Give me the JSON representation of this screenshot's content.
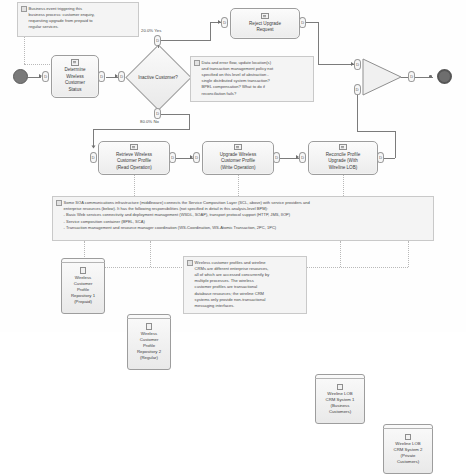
{
  "diagram": {
    "type": "bpmn-process-diagram"
  },
  "events": {
    "start": {
      "name": "start-event",
      "label": ""
    },
    "end": {
      "name": "end-event",
      "label": ""
    }
  },
  "tasks": {
    "determine_status": {
      "label": "Determine\nWireless\nCustomer\nStatus"
    },
    "reject_upgrade": {
      "label": "Reject Upgrade\nRequest"
    },
    "retrieve_profile": {
      "label": "Retrieve Wireless\nCustomer Profile\n(Read Operation)"
    },
    "upgrade_profile": {
      "label": "Upgrade Wireless\nCustomer Profile\n(Write Operation)"
    },
    "reconcile_profile": {
      "label": "Reconcile Profile\nUpgrade (With\nWireline LOB)"
    }
  },
  "gateway": {
    "label": "Inactive Customer?",
    "yes_label": "20.0% Yes",
    "no_label": "80.0% No"
  },
  "notes": {
    "note1": "Business event triggering this\nbusiness process: customer enquiry,\nrequesting upgrade from prepaid to\nregular services.",
    "note2": "Data and error flow, update location(s)\nand transaction management policy not\nspecified on this level of abstraction -\nsingle distributed system transaction?\nBPEL compensation? What to do if\nreconciliation fails?",
    "note3": "Some SOA communications infrastructure (middleware) connects the Service Composition Layer (SCL, above) with service providers and\nenterprise resources (below). It has the following responsibilities (not specified in detail in this analysis-level BPM):\n- Basic Web services connectivity and deployment management (WSDL, SOAP), transport protocol support (HTTP, JMS, IIOP)\n- Service composition container (BPEL, SCA)\n- Transaction management and resource manager coordination (WS-Coordination, WS-Atomic Transaction, 2PC, 1PC)",
    "note4": "Wireless customer profiles and wireline\nCRMs are different enterprise resources,\nall of which are accessed concurrently by\nmultiple processes. The wireless\ncustomer profiles are transactional\ndatabase resources; the wireline CRM\nsystems only provide non-transactional\nmessaging interfaces."
  },
  "datastores": {
    "ds1": {
      "label": "Wireless\nCustomer\nProfile\nRepository 1\n(Prepaid)"
    },
    "ds2": {
      "label": "Wireless\nCustomer\nProfile\nRepository 2\n(Regular)"
    },
    "ds3": {
      "label": "Wireline LOB\nCRM System 1\n(Business\nCustomers)"
    },
    "ds4": {
      "label": "Wireline LOB\nCRM System 2\n(Private\nCustomers)"
    }
  },
  "colors": {
    "shape_fill": "#eeeeee",
    "shape_stroke": "#9d9d9d",
    "note_fill": "#f4f4f4",
    "connector": "#7b7b7b",
    "event_fill": "#6e6e6e"
  }
}
